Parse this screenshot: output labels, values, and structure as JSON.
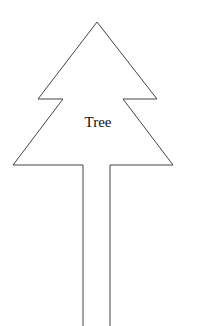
{
  "diagram": {
    "shape": "tree",
    "label": "Tree",
    "stroke_color": "#444444",
    "fill_color": "#ffffff",
    "outline_points": [
      [
        83,
        326
      ],
      [
        83,
        165
      ],
      [
        13,
        165
      ],
      [
        63,
        99
      ],
      [
        38,
        99
      ],
      [
        97,
        22
      ],
      [
        157,
        99
      ],
      [
        123,
        99
      ],
      [
        173,
        165
      ],
      [
        110,
        165
      ],
      [
        110,
        326
      ]
    ]
  }
}
